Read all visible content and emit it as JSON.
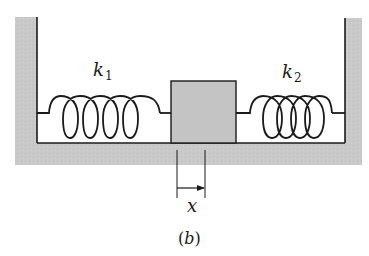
{
  "figure": {
    "caption": "(b)",
    "caption_parts": {
      "open": "(",
      "letter": "b",
      "close": ")"
    },
    "colors": {
      "wall_fill": "#c9c9c9",
      "block_fill": "#c4c4c4",
      "line": "#1a1a1a",
      "background": "#ffffff"
    }
  },
  "springs": [
    {
      "id": "spring-left",
      "label": "k",
      "subscript": "1"
    },
    {
      "id": "spring-right",
      "label": "k",
      "subscript": "2"
    }
  ],
  "mass": {
    "label": ""
  },
  "displacement": {
    "label": "x"
  }
}
